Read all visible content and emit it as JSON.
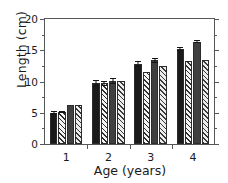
{
  "chart_data": {
    "type": "bar",
    "title": "",
    "xlabel": "Age (years)",
    "ylabel": "Length (cm)",
    "categories": [
      "1",
      "2",
      "3",
      "4"
    ],
    "xtick_labels": [
      "1",
      "2",
      "3",
      "4"
    ],
    "ytick_labels": [
      "0",
      "5",
      "10",
      "15",
      "20"
    ],
    "ytick_values": [
      0,
      5,
      10,
      15,
      20
    ],
    "yminor_values": [
      2.5,
      7.5,
      12.5,
      17.5
    ],
    "ylim": [
      0,
      20
    ],
    "grid": false,
    "legend": "none",
    "series": [
      {
        "name": "series-1-solid-black",
        "fill": "solid-black",
        "color": "#1a1a1a",
        "values": [
          5.0,
          9.7,
          12.8,
          15.2
        ],
        "errors": [
          0.25,
          0.55,
          0.45,
          0.3
        ]
      },
      {
        "name": "series-2-hatched",
        "fill": "hatch",
        "color": "#f4f4f4",
        "values": [
          5.1,
          9.7,
          11.5,
          13.3
        ],
        "errors": [
          0.2,
          0.4,
          0.0,
          0.0
        ]
      },
      {
        "name": "series-3-solid-gray",
        "fill": "solid-gray",
        "color": "#3d3f41",
        "values": [
          6.3,
          10.1,
          13.4,
          16.4
        ],
        "errors": [
          0.0,
          0.45,
          0.4,
          0.3
        ]
      },
      {
        "name": "series-4-hatched",
        "fill": "hatch2",
        "color": "#ededed",
        "values": [
          6.3,
          10.15,
          12.5,
          13.5
        ],
        "errors": [
          0.0,
          0.0,
          0.0,
          0.0
        ]
      }
    ]
  }
}
